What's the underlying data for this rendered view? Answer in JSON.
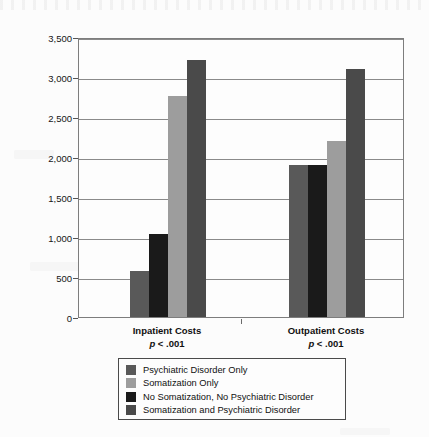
{
  "chart_data": {
    "type": "bar",
    "title": "",
    "xlabel": "",
    "ylabel": "Adjusted Effect Estimate, $",
    "ylim": [
      0,
      3500
    ],
    "ytick_values": [
      0,
      500,
      1000,
      1500,
      2000,
      2500,
      3000,
      3500
    ],
    "ytick_labels": [
      "0",
      "500",
      "1,000",
      "1,500",
      "2,000",
      "2,500",
      "3,000",
      "3,500"
    ],
    "grid": true,
    "legend_position": "below-plot",
    "categories": [
      "Inpatient Costs",
      "Outpatient Costs"
    ],
    "category_annotations": [
      "p < .001",
      "p < .001"
    ],
    "bar_draw_order": [
      "Psychiatric Disorder Only",
      "No Somatization, No Psychiatric Disorder",
      "Somatization Only",
      "Somatization and Psychiatric Disorder"
    ],
    "series": [
      {
        "name": "Psychiatric Disorder Only",
        "color": "#595959",
        "values": [
          580,
          1900
        ]
      },
      {
        "name": "Somatization Only",
        "color": "#9d9d9d",
        "values": [
          2760,
          2200
        ]
      },
      {
        "name": "No Somatization, No Psychiatric Disorder",
        "color": "#1a1a1a",
        "values": [
          1040,
          1900
        ]
      },
      {
        "name": "Somatization and Psychiatric Disorder",
        "color": "#4a4a4a",
        "values": [
          3210,
          3100
        ]
      }
    ]
  },
  "axis": {
    "y_title": "Adjusted Effect Estimate, $",
    "ticks": [
      "3,500",
      "3,000",
      "2,500",
      "2,000",
      "1,500",
      "1,000",
      "500",
      "0"
    ]
  },
  "groups": [
    {
      "label": "Inpatient Costs",
      "pvalue": "p < .001"
    },
    {
      "label": "Outpatient Costs",
      "pvalue": "p < .001"
    }
  ],
  "legend": {
    "items": [
      {
        "label": "Psychiatric Disorder Only",
        "color": "#595959"
      },
      {
        "label": "Somatization Only",
        "color": "#9d9d9d"
      },
      {
        "label": "No Somatization, No Psychiatric Disorder",
        "color": "#1a1a1a"
      },
      {
        "label": "Somatization and Psychiatric Disorder",
        "color": "#4a4a4a"
      }
    ]
  }
}
